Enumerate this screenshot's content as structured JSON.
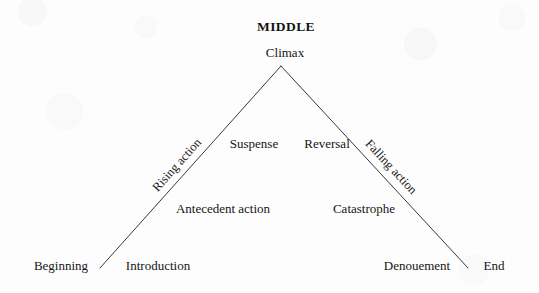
{
  "figure": {
    "type": "freytag-pyramid",
    "background_color": "#fdfdfd",
    "line_color": "#39393c",
    "text_color": "#151515"
  },
  "geometry": {
    "apex": {
      "x": 281,
      "y": 66
    },
    "left_base": {
      "x": 100,
      "y": 268
    },
    "right_base": {
      "x": 468,
      "y": 268
    },
    "line_width_px": 1
  },
  "labels": {
    "middle": "MIDDLE",
    "climax": "Climax",
    "rising_action": "Rising action",
    "suspense": "Suspense",
    "reversal": "Reversal",
    "falling_action": "Falling action",
    "antecedent_action": "Antecedent action",
    "catastrophe": "Catastrophe",
    "beginning": "Beginning",
    "introduction": "Introduction",
    "denouement": "Denouement",
    "end": "End"
  },
  "positions": {
    "middle": {
      "x": 286,
      "y": 27
    },
    "climax": {
      "x": 285,
      "y": 52
    },
    "rising_action": {
      "x": 177,
      "y": 165
    },
    "suspense": {
      "x": 254,
      "y": 143
    },
    "reversal": {
      "x": 327,
      "y": 143
    },
    "falling_action": {
      "x": 391,
      "y": 167
    },
    "antecedent_action": {
      "x": 223,
      "y": 208
    },
    "catastrophe": {
      "x": 364,
      "y": 208
    },
    "beginning": {
      "x": 61,
      "y": 265
    },
    "introduction": {
      "x": 158,
      "y": 265
    },
    "denouement": {
      "x": 417,
      "y": 265
    },
    "end": {
      "x": 494,
      "y": 265
    }
  }
}
